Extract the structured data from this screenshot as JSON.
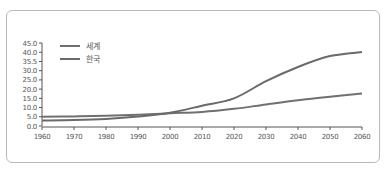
{
  "chart_data": {
    "type": "line",
    "title": "",
    "xlabel": "",
    "ylabel": "",
    "x": [
      1960,
      1970,
      1980,
      1990,
      2000,
      2010,
      2020,
      2030,
      2040,
      2050,
      2060
    ],
    "y_tick_labels": [
      "45.0",
      "40.0",
      "35.5",
      "30.0",
      "25.0",
      "20.0",
      "15.0",
      "10.0",
      "5.0",
      "0.0"
    ],
    "x_tick_labels": [
      "1960",
      "1970",
      "1980",
      "1990",
      "2000",
      "2010",
      "2020",
      "2030",
      "2040",
      "2050",
      "2060"
    ],
    "ylim": [
      0,
      45
    ],
    "grid": false,
    "legend_position": "top-left",
    "series": [
      {
        "name": "세계",
        "color": "#707070",
        "values": [
          5.0,
          5.2,
          5.5,
          6.1,
          6.9,
          7.6,
          9.3,
          11.7,
          14.0,
          15.9,
          17.6
        ]
      },
      {
        "name": "한국",
        "color": "#6a6a6a",
        "values": [
          3.0,
          3.2,
          3.8,
          5.1,
          7.2,
          11.0,
          15.0,
          24.3,
          32.0,
          37.9,
          40.1
        ]
      }
    ]
  },
  "legend": {
    "world": "세계",
    "korea": "한국"
  }
}
